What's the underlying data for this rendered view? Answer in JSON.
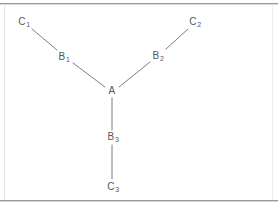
{
  "figure": {
    "width": 278,
    "height": 206,
    "background_color": "#ffffff",
    "line_color": "#7d7d82",
    "label_color": "#57575b",
    "rule_color": "#9a9a9a"
  },
  "nodes": [
    {
      "id": "A",
      "base": "A",
      "sub": "",
      "x": 112,
      "y": 91,
      "label": "A"
    },
    {
      "id": "B1",
      "base": "B",
      "sub": "1",
      "x": 64,
      "y": 57,
      "label": "B1"
    },
    {
      "id": "B2",
      "base": "B",
      "sub": "2",
      "x": 158,
      "y": 56,
      "label": "B2"
    },
    {
      "id": "B3",
      "base": "B",
      "sub": "3",
      "x": 113,
      "y": 137,
      "label": "B3"
    },
    {
      "id": "C1",
      "base": "C",
      "sub": "1",
      "x": 24,
      "y": 22,
      "label": "C1"
    },
    {
      "id": "C2",
      "base": "C",
      "sub": "2",
      "x": 195,
      "y": 22,
      "label": "C2"
    },
    {
      "id": "C3",
      "base": "C",
      "sub": "3",
      "x": 113,
      "y": 187,
      "label": "C3"
    }
  ],
  "edges": [
    {
      "id": "edge-A-B1",
      "from": "A",
      "to": "B1",
      "x1": 105,
      "y1": 87,
      "x2": 73,
      "y2": 63
    },
    {
      "id": "edge-A-B2",
      "from": "A",
      "to": "B2",
      "x1": 119,
      "y1": 87,
      "x2": 150,
      "y2": 62
    },
    {
      "id": "edge-A-B3",
      "from": "A",
      "to": "B3",
      "x1": 112,
      "y1": 98,
      "x2": 112,
      "y2": 130
    },
    {
      "id": "edge-B1-C1",
      "from": "B1",
      "to": "C1",
      "x1": 57,
      "y1": 50,
      "x2": 32,
      "y2": 29
    },
    {
      "id": "edge-B2-C2",
      "from": "B2",
      "to": "C2",
      "x1": 166,
      "y1": 49,
      "x2": 188,
      "y2": 29
    },
    {
      "id": "edge-B3-C3",
      "from": "B3",
      "to": "C3",
      "x1": 112,
      "y1": 145,
      "x2": 112,
      "y2": 179
    }
  ],
  "rules": [
    {
      "id": "top-rule",
      "y": 3,
      "label": "top-border-rule"
    },
    {
      "id": "bottom-rule",
      "y": 200,
      "label": "bottom-border-rule"
    }
  ]
}
